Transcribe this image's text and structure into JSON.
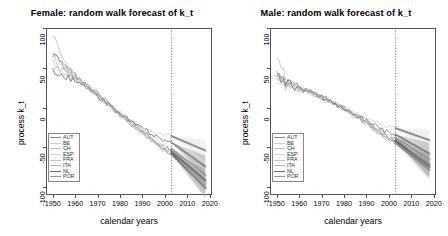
{
  "figure": {
    "axis_x_label": "calendar years",
    "axis_y_label": "process k_t"
  },
  "panels": [
    {
      "id": "female",
      "title": "Female: random walk forecast of k_t"
    },
    {
      "id": "male",
      "title": "Male: random walk forecast of k_t"
    }
  ],
  "legend": {
    "items": [
      {
        "label": "AUT",
        "color": "#8c8c8c"
      },
      {
        "label": "BE",
        "color": "#c9c9c9"
      },
      {
        "label": "CH",
        "color": "#bdbdbd"
      },
      {
        "label": "ESP",
        "color": "#d2d2d2"
      },
      {
        "label": "FRA",
        "color": "#c4c4c4"
      },
      {
        "label": "ITA",
        "color": "#b3b3b3"
      },
      {
        "label": "NL",
        "color": "#707070"
      },
      {
        "label": "POR",
        "color": "#9a9a9a"
      }
    ]
  },
  "chart_data": {
    "type": "line",
    "xlabel": "calendar years",
    "ylabel": "process k_t",
    "xlim": [
      1947,
      2021
    ],
    "ylim": [
      -110,
      100
    ],
    "xticks": [
      1950,
      1960,
      1970,
      1980,
      1990,
      2000,
      2010,
      2020
    ],
    "yticks": [
      100,
      50,
      0,
      -50,
      -100
    ],
    "grid": false,
    "legend_position": "bottom-left",
    "forecast_start_year": 2003,
    "forecast_divider_style": "dotted vertical line",
    "forecast_marker": "open circles",
    "annotations": [
      "vertical dotted line at 2003 separating fitted history from random-walk forecast"
    ],
    "panels": [
      {
        "name": "female",
        "title": "Female: random walk forecast of k_t",
        "x": [
          1950,
          1955,
          1960,
          1965,
          1970,
          1975,
          1980,
          1985,
          1990,
          1995,
          2000,
          2003,
          2008,
          2013,
          2018
        ],
        "series": [
          {
            "name": "AUT",
            "color": "#8c8c8c",
            "values": [
              68,
              52,
              40,
              30,
              18,
              6,
              -6,
              -18,
              -30,
              -42,
              -54,
              -58,
              -72,
              -86,
              -100
            ],
            "forecast_from": 2003
          },
          {
            "name": "BE",
            "color": "#c9c9c9",
            "values": [
              62,
              50,
              38,
              28,
              17,
              5,
              -7,
              -17,
              -28,
              -38,
              -48,
              -52,
              -63,
              -74,
              -85
            ],
            "forecast_from": 2003
          },
          {
            "name": "CH",
            "color": "#bdbdbd",
            "values": [
              95,
              55,
              41,
              29,
              16,
              4,
              -8,
              -20,
              -31,
              -43,
              -53,
              -57,
              -70,
              -83,
              -96
            ],
            "forecast_from": 2003
          },
          {
            "name": "ESP",
            "color": "#d2d2d2",
            "values": [
              46,
              44,
              36,
              27,
              15,
              3,
              -9,
              -19,
              -27,
              -33,
              -35,
              -36,
              -42,
              -48,
              -54
            ],
            "forecast_from": 2003
          },
          {
            "name": "FRA",
            "color": "#c4c4c4",
            "values": [
              55,
              47,
              37,
              27,
              15,
              3,
              -9,
              -20,
              -31,
              -42,
              -52,
              -56,
              -68,
              -80,
              -92
            ],
            "forecast_from": 2003
          },
          {
            "name": "ITA",
            "color": "#b3b3b3",
            "values": [
              50,
              45,
              36,
              26,
              14,
              2,
              -10,
              -21,
              -32,
              -44,
              -55,
              -59,
              -73,
              -87,
              -101
            ],
            "forecast_from": 2003
          },
          {
            "name": "NL",
            "color": "#707070",
            "values": [
              44,
              40,
              33,
              25,
              14,
              3,
              -8,
              -18,
              -26,
              -34,
              -41,
              -44,
              -54,
              -64,
              -74
            ],
            "forecast_from": 2003
          },
          {
            "name": "POR",
            "color": "#9a9a9a",
            "values": [
              70,
              53,
              39,
              28,
              16,
              4,
              -8,
              -19,
              -30,
              -41,
              -51,
              -55,
              -67,
              -79,
              -91
            ],
            "forecast_from": 2003
          }
        ]
      },
      {
        "name": "male",
        "title": "Male: random walk forecast of k_t",
        "x": [
          1950,
          1955,
          1960,
          1965,
          1970,
          1975,
          1980,
          1985,
          1990,
          1995,
          2000,
          2003,
          2008,
          2013,
          2018
        ],
        "series": [
          {
            "name": "AUT",
            "color": "#8c8c8c",
            "values": [
              40,
              30,
              24,
              20,
              14,
              8,
              0,
              -8,
              -17,
              -28,
              -38,
              -42,
              -53,
              -64,
              -75
            ],
            "forecast_from": 2003
          },
          {
            "name": "BE",
            "color": "#c9c9c9",
            "values": [
              38,
              31,
              25,
              20,
              13,
              7,
              -1,
              -9,
              -18,
              -27,
              -35,
              -38,
              -47,
              -56,
              -65
            ],
            "forecast_from": 2003
          },
          {
            "name": "CH",
            "color": "#bdbdbd",
            "values": [
              62,
              34,
              25,
              20,
              13,
              6,
              -2,
              -10,
              -19,
              -29,
              -38,
              -41,
              -51,
              -61,
              -71
            ],
            "forecast_from": 2003
          },
          {
            "name": "ESP",
            "color": "#d2d2d2",
            "values": [
              27,
              26,
              23,
              19,
              13,
              7,
              0,
              -7,
              -14,
              -20,
              -25,
              -26,
              -31,
              -36,
              -41
            ],
            "forecast_from": 2003
          },
          {
            "name": "FRA",
            "color": "#c4c4c4",
            "values": [
              36,
              29,
              24,
              19,
              12,
              6,
              -2,
              -11,
              -20,
              -30,
              -39,
              -42,
              -52,
              -62,
              -72
            ],
            "forecast_from": 2003
          },
          {
            "name": "ITA",
            "color": "#b3b3b3",
            "values": [
              33,
              28,
              23,
              19,
              12,
              5,
              -3,
              -11,
              -21,
              -31,
              -41,
              -45,
              -56,
              -67,
              -78
            ],
            "forecast_from": 2003
          },
          {
            "name": "NL",
            "color": "#707070",
            "values": [
              41,
              30,
              24,
              19,
              13,
              7,
              -1,
              -9,
              -17,
              -25,
              -32,
              -34,
              -42,
              -50,
              -58
            ],
            "forecast_from": 2003
          },
          {
            "name": "POR",
            "color": "#9a9a9a",
            "values": [
              42,
              32,
              25,
              20,
              13,
              6,
              -2,
              -11,
              -20,
              -30,
              -39,
              -42,
              -53,
              -64,
              -74
            ],
            "forecast_from": 2003
          }
        ]
      }
    ]
  }
}
